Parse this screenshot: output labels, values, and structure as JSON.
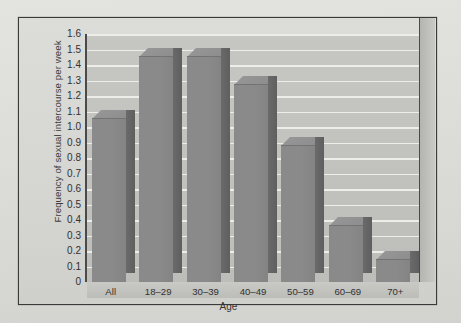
{
  "chart_data": {
    "type": "bar",
    "title": "",
    "subtitle": "",
    "xlabel": "Age",
    "ylabel": "Frequency of sexual intercourse per week",
    "categories": [
      "All",
      "18–29",
      "30–39",
      "40–49",
      "50–59",
      "60–69",
      "70+"
    ],
    "values": [
      1.05,
      1.45,
      1.45,
      1.27,
      0.88,
      0.36,
      0.14
    ],
    "series": [
      {
        "name": "Frequency of sexual intercourse per week",
        "values": [
          1.05,
          1.45,
          1.45,
          1.27,
          0.88,
          0.36,
          0.14
        ]
      }
    ],
    "ylim": [
      0,
      1.6
    ],
    "ytick_step": 0.1,
    "ytick_labels": [
      "1.6",
      "1.5",
      "1.4",
      "1.3",
      "1.2",
      "1.1",
      "1.0",
      "0.9",
      "0.8",
      "0.7",
      "0.6",
      "0.5",
      "0.4",
      "0.3",
      "0.2",
      "0.1",
      "0"
    ],
    "grid": true,
    "grid_axis": "y",
    "legend": false,
    "legend_position": "none",
    "style": "3d-column",
    "bar_color": "#8a8a8a",
    "bar_side_color": "#6a6a6a",
    "bar_top_color": "#969696",
    "plot_background": "#c3c3bf",
    "figure_background": "#d8d8d4",
    "gridline_color": "#eeeeeb",
    "axis_color": "#4a4a4a",
    "text_color": "#333333"
  }
}
